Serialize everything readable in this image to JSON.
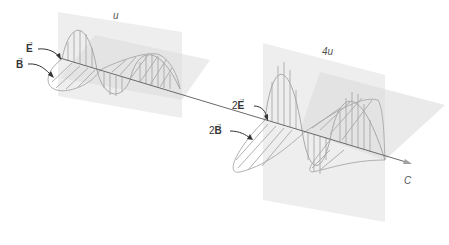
{
  "diagram": {
    "type": "electromagnetic-wave-energy-comparison",
    "left_wave": {
      "energy_label": "u",
      "electric_field_label": "E",
      "magnetic_field_label": "B"
    },
    "right_wave": {
      "energy_label": "4u",
      "electric_field_label": "2E",
      "magnetic_field_label": "2B",
      "electric_prefix": "2",
      "magnetic_prefix": "2"
    },
    "propagation": {
      "speed_label": "C"
    },
    "colors": {
      "plane": "#e6e6e6",
      "wave_stroke": "#a8a8a8",
      "axis": "#6a6a6a",
      "arrow_pointer": "#333333"
    }
  }
}
